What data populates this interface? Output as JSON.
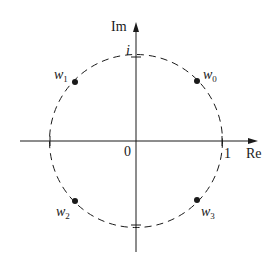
{
  "diagram": {
    "axes": {
      "x_label": "Re",
      "y_label": "Im",
      "origin_label": "0",
      "x_tick_label": "1",
      "y_tick_label": "i"
    },
    "circle": {
      "style": "dashed",
      "radius_label": "1"
    },
    "points": [
      {
        "name": "w",
        "sub": "0",
        "quadrant": "I"
      },
      {
        "name": "w",
        "sub": "1",
        "quadrant": "II"
      },
      {
        "name": "w",
        "sub": "2",
        "quadrant": "III"
      },
      {
        "name": "w",
        "sub": "3",
        "quadrant": "IV"
      }
    ],
    "colors": {
      "ink": "#1a1a1a",
      "background": "#ffffff"
    }
  }
}
